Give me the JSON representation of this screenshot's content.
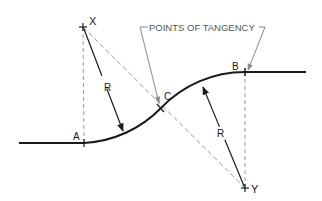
{
  "diagram": {
    "title_label": "POINTS OF TANGENCY",
    "points": {
      "X": {
        "label": "X",
        "role": "center of curve 1"
      },
      "Y": {
        "label": "Y",
        "role": "center of curve 2"
      },
      "A": {
        "label": "A",
        "role": "point of tangency"
      },
      "B": {
        "label": "B",
        "role": "point of tangency"
      },
      "C": {
        "label": "C",
        "role": "point of tangency (reverse curve)"
      }
    },
    "radius_labels": [
      "R",
      "R"
    ],
    "colors": {
      "curve": "#1a1a1a",
      "dashed": "#9a9a9a",
      "leader": "#7a7a7a",
      "background": "#ffffff"
    }
  }
}
